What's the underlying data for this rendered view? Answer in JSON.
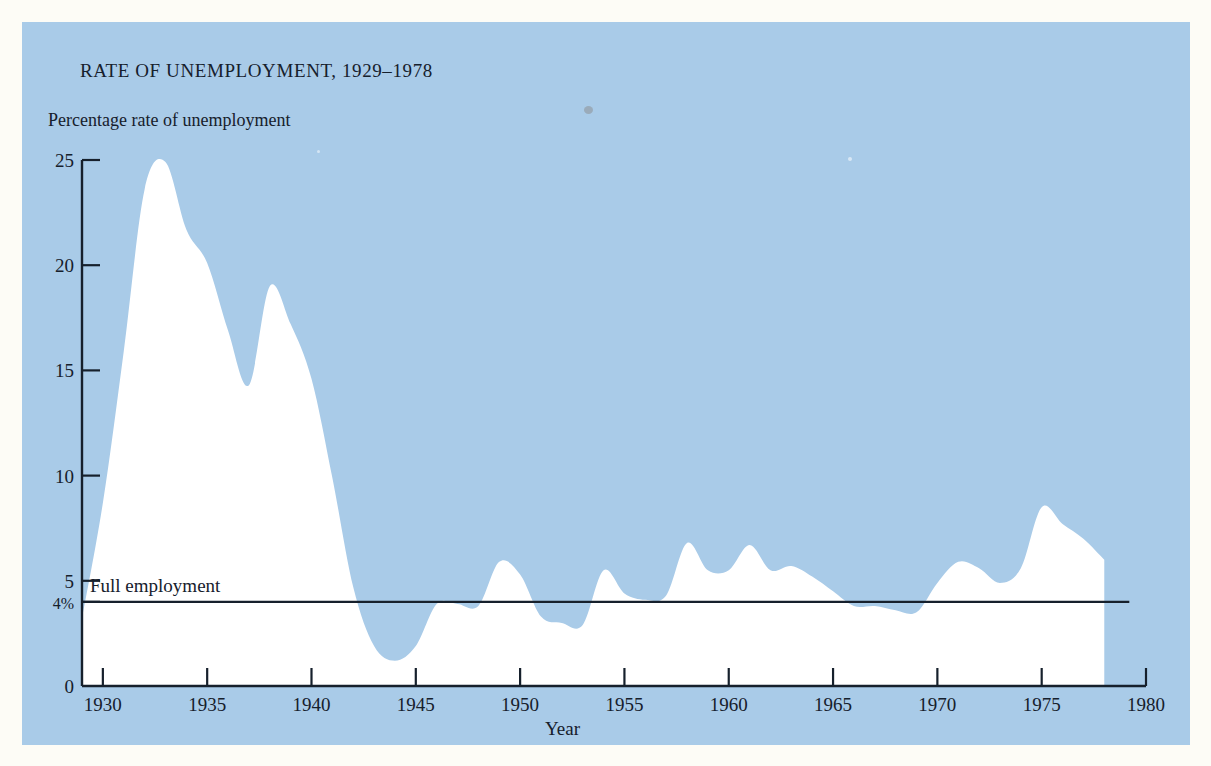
{
  "figure": {
    "panel_color": "#a9cbe8",
    "page_color": "#fdfcf6",
    "ink_color": "#16202c",
    "series_fill": "#ffffff"
  },
  "chart_data": {
    "type": "area",
    "title": "RATE OF UNEMPLOYMENT, 1929–1978",
    "subtitle": "Percentage rate of unemployment",
    "xlabel": "Year",
    "ylabel": "Percentage rate of unemployment",
    "xlim": [
      1929,
      1980
    ],
    "ylim": [
      0,
      25
    ],
    "grid": false,
    "legend": null,
    "inverted_fill_note": "Area above the unemployment line is shaded background blue; area below the line is white.",
    "xticks": [
      1930,
      1935,
      1940,
      1945,
      1950,
      1955,
      1960,
      1965,
      1970,
      1975,
      1980
    ],
    "xticklabels": [
      "1930",
      "1935",
      "1940",
      "1945",
      "1950",
      "1955",
      "1960",
      "1965",
      "1970",
      "1975",
      "1980"
    ],
    "yticks": [
      0,
      4,
      5,
      10,
      15,
      20,
      25
    ],
    "yticklabels": [
      "0",
      "4%",
      "5",
      "10",
      "15",
      "20",
      "25"
    ],
    "annotations": [
      {
        "name": "full-employment-line",
        "label": "Full employment",
        "y_value": 4,
        "x_start": 1929,
        "x_end": 1979.2,
        "style": "horizontal-rule"
      }
    ],
    "series": [
      {
        "name": "Rate of unemployment",
        "x": [
          1929,
          1930,
          1931,
          1932,
          1933,
          1934,
          1935,
          1936,
          1937,
          1938,
          1939,
          1940,
          1941,
          1942,
          1943,
          1944,
          1945,
          1946,
          1947,
          1948,
          1949,
          1950,
          1951,
          1952,
          1953,
          1954,
          1955,
          1956,
          1957,
          1958,
          1959,
          1960,
          1961,
          1962,
          1963,
          1964,
          1965,
          1966,
          1967,
          1968,
          1969,
          1970,
          1971,
          1972,
          1973,
          1974,
          1975,
          1976,
          1977,
          1978
        ],
        "values": [
          3.2,
          8.7,
          15.9,
          23.6,
          24.9,
          21.7,
          20.1,
          16.9,
          14.3,
          19.0,
          17.2,
          14.6,
          9.9,
          4.7,
          1.9,
          1.2,
          1.9,
          3.9,
          3.9,
          3.8,
          5.9,
          5.3,
          3.3,
          3.0,
          2.9,
          5.5,
          4.4,
          4.1,
          4.3,
          6.8,
          5.5,
          5.5,
          6.7,
          5.5,
          5.7,
          5.2,
          4.5,
          3.8,
          3.8,
          3.6,
          3.5,
          4.9,
          5.9,
          5.6,
          4.9,
          5.6,
          8.5,
          7.7,
          7.0,
          6.0
        ],
        "units": "percent"
      }
    ],
    "notable_points": [
      {
        "year": 1933,
        "value": 24.9,
        "note": "Great Depression peak"
      },
      {
        "year": 1938,
        "value": 19.0,
        "note": "Recession of 1937-38"
      },
      {
        "year": 1944,
        "value": 1.2,
        "note": "World War II trough"
      },
      {
        "year": 1975,
        "value": 8.5,
        "note": "Mid-1970s recession peak"
      }
    ]
  }
}
